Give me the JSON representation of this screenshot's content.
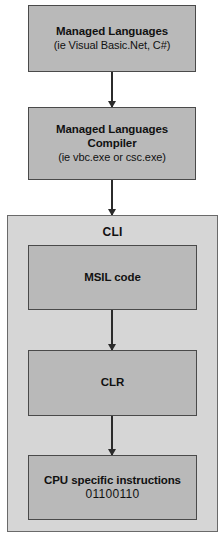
{
  "diagram": {
    "background_color": "#ffffff",
    "node_fill_color": "#b9b9b9",
    "group_fill_color": "#d6d6d6",
    "border_color": "#4a4a4a",
    "arrow_color": "#2b2b2b"
  },
  "nodes": {
    "managed_languages": {
      "title": "Managed Languages",
      "subtitle": "(ie Visual Basic.Net, C#)"
    },
    "compiler": {
      "title_line1": "Managed Languages",
      "title_line2": "Compiler",
      "subtitle": "(ie vbc.exe or csc.exe)"
    },
    "msil": {
      "title": "MSIL code"
    },
    "clr": {
      "title": "CLR"
    },
    "cpu": {
      "title": "CPU specific instructions",
      "subtitle": "01100110"
    }
  },
  "group": {
    "cli": {
      "label": "CLI"
    }
  },
  "arrows": [
    {
      "name": "managed-languages-to-compiler",
      "from": "managed_languages",
      "to": "compiler"
    },
    {
      "name": "compiler-to-cli",
      "from": "compiler",
      "to": "cli"
    },
    {
      "name": "msil-to-clr",
      "from": "msil",
      "to": "clr"
    },
    {
      "name": "clr-to-cpu",
      "from": "clr",
      "to": "cpu"
    }
  ]
}
